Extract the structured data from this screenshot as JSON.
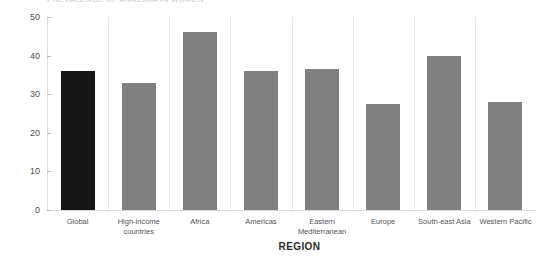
{
  "chart_data": {
    "type": "bar",
    "title": "PREVALENCE OF ANAEMIA IN WOMEN",
    "xlabel": "REGION",
    "ylabel": "",
    "ylim": [
      0,
      50
    ],
    "yticks": [
      0,
      10,
      20,
      30,
      40,
      50
    ],
    "grid": false,
    "legend": "none",
    "categories": [
      "Global",
      "High-income\ncountries",
      "Africa",
      "Americas",
      "Eastern\nMediterranean",
      "Europe",
      "South-east Asia",
      "Western Pacific"
    ],
    "values": [
      36,
      33,
      46,
      36,
      36.5,
      27.5,
      40,
      28
    ],
    "colors": [
      "#151515",
      "#808080",
      "#808080",
      "#808080",
      "#808080",
      "#808080",
      "#808080",
      "#808080"
    ],
    "accent_color": "#151515",
    "bar_color": "#808080"
  }
}
